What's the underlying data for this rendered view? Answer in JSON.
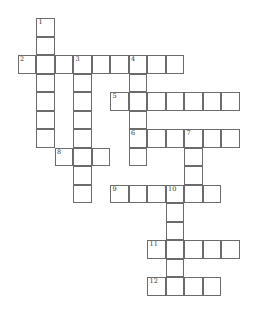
{
  "puzzle": {
    "type": "crossword",
    "cell_size": 18.5,
    "origin": {
      "x": 17.5,
      "y": 18
    },
    "entries": [
      {
        "number": "1",
        "direction": "down",
        "row": 0,
        "col": 1,
        "length": 7
      },
      {
        "number": "2",
        "direction": "across",
        "row": 2,
        "col": 0,
        "length": 9
      },
      {
        "number": "3",
        "direction": "down",
        "row": 2,
        "col": 3,
        "length": 8
      },
      {
        "number": "4",
        "direction": "down",
        "row": 2,
        "col": 6,
        "length": 6
      },
      {
        "number": "5",
        "direction": "across",
        "row": 4,
        "col": 5,
        "length": 7
      },
      {
        "number": "6",
        "direction": "across",
        "row": 6,
        "col": 6,
        "length": 6
      },
      {
        "number": "7",
        "direction": "down",
        "row": 6,
        "col": 9,
        "length": 4
      },
      {
        "number": "8",
        "direction": "across",
        "row": 7,
        "col": 2,
        "length": 3
      },
      {
        "number": "9",
        "direction": "across",
        "row": 9,
        "col": 5,
        "length": 6
      },
      {
        "number": "10",
        "direction": "down",
        "row": 9,
        "col": 8,
        "length": 6
      },
      {
        "number": "11",
        "direction": "across",
        "row": 12,
        "col": 7,
        "length": 5
      },
      {
        "number": "12",
        "direction": "across",
        "row": 14,
        "col": 7,
        "length": 4
      }
    ]
  }
}
